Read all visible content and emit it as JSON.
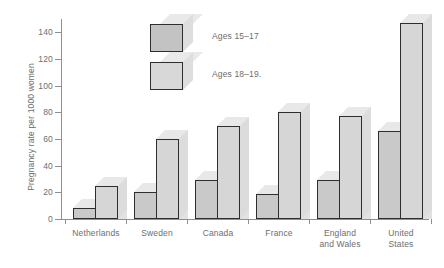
{
  "chart_data": {
    "type": "bar",
    "title": "",
    "xlabel": "",
    "ylabel": "Pregnancy rate per 1000 women",
    "ylim": [
      0,
      150
    ],
    "yticks": [
      0,
      20,
      40,
      60,
      80,
      100,
      120,
      140
    ],
    "grid": false,
    "legend_position": "inside-top-left",
    "categories": [
      "Netherlands",
      "Sweden",
      "Canada",
      "France",
      "England\nand Wales",
      "United\nStates"
    ],
    "series": [
      {
        "name": "Ages 15–17",
        "values": [
          8,
          20,
          29,
          19,
          29,
          66
        ]
      },
      {
        "name": "Ages 18–19",
        "values": [
          25,
          60,
          70,
          80,
          77,
          147
        ]
      }
    ]
  },
  "axis": {
    "y_title": "Pregnancy rate per 1000 women",
    "tick_labels": [
      "140",
      "120",
      "100",
      "80",
      "60",
      "40",
      "20",
      "0"
    ]
  },
  "legend": {
    "items": [
      {
        "label": "Ages 15–17"
      },
      {
        "label": "Ages 18–19."
      }
    ]
  },
  "x_labels": [
    {
      "line1": "Netherlands",
      "line2": ""
    },
    {
      "line1": "Sweden",
      "line2": ""
    },
    {
      "line1": "Canada",
      "line2": ""
    },
    {
      "line1": "France",
      "line2": ""
    },
    {
      "line1": "England",
      "line2": "and Wales"
    },
    {
      "line1": "United",
      "line2": "States"
    }
  ],
  "colors": {
    "bar_dark": "#c9c9c9",
    "bar_light": "#d6d6d6",
    "bar_outline": "#2e2e2e",
    "shadow": "#e2e2e2",
    "axis": "#8f8f8f",
    "text": "#6e6e6e",
    "background": "#ffffff"
  }
}
